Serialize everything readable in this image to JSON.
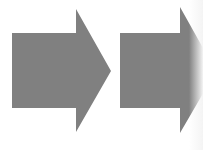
{
  "diagram": {
    "type": "arrow-sequence",
    "direction": "right",
    "fill_color": "#808080",
    "background_color": "#ffffff",
    "arrows": [
      {
        "id": "arrow-1",
        "points": "12,33 76,33 76,9 111,71 76,132 76,108 12,108"
      },
      {
        "id": "arrow-2",
        "points": "120,33 180,33 180,7 216,71 180,133 180,108 120,108"
      }
    ]
  }
}
